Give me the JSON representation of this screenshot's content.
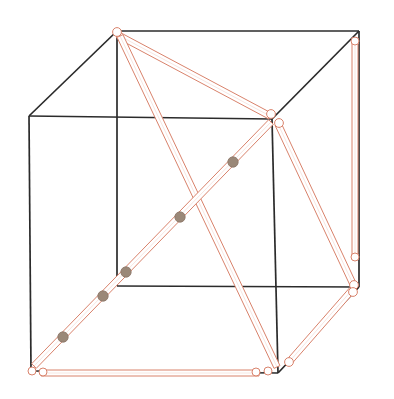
{
  "figure": {
    "canvas": {
      "width": 394,
      "height": 399,
      "background": "#ffffff"
    },
    "colors": {
      "cube_edge": "#2b2b2b",
      "strut_outline": "#d9826b",
      "strut_fill": "#ffffff",
      "joint_outline": "#d9826b",
      "joint_fill": "#ffffff",
      "node_fill": "#9a8878",
      "node_stroke": "#8a7464"
    },
    "stroke_widths": {
      "cube_edge": 1.7,
      "strut_outline": 1.0,
      "joint_outline": 1.0
    },
    "cube": {
      "label": "wireframe-cube",
      "vertices": {
        "front_top_left": {
          "name": "A",
          "x": 29,
          "y": 116
        },
        "front_top_right": {
          "name": "B",
          "x": 272,
          "y": 119
        },
        "front_bottom_left": {
          "name": "C",
          "x": 31,
          "y": 371
        },
        "front_bottom_right": {
          "name": "D",
          "x": 278,
          "y": 373
        },
        "back_top_left": {
          "name": "E",
          "x": 117,
          "y": 31
        },
        "back_top_right": {
          "name": "F",
          "x": 359,
          "y": 31
        },
        "back_bottom_left": {
          "name": "G",
          "x": 117,
          "y": 286
        },
        "back_bottom_right": {
          "name": "H",
          "x": 359,
          "y": 287
        }
      },
      "edges": [
        {
          "name": "front-top",
          "from": "front_top_left",
          "to": "front_top_right"
        },
        {
          "name": "front-left",
          "from": "front_top_left",
          "to": "front_bottom_left"
        },
        {
          "name": "front-bottom",
          "from": "front_bottom_left",
          "to": "front_bottom_right"
        },
        {
          "name": "front-right",
          "from": "front_top_right",
          "to": "front_bottom_right"
        },
        {
          "name": "back-top",
          "from": "back_top_left",
          "to": "back_top_right"
        },
        {
          "name": "back-left",
          "from": "back_top_left",
          "to": "back_bottom_left"
        },
        {
          "name": "back-bottom",
          "from": "back_bottom_left",
          "to": "back_bottom_right"
        },
        {
          "name": "back-right",
          "from": "back_top_right",
          "to": "back_bottom_right"
        },
        {
          "name": "top-left-connect",
          "from": "front_top_left",
          "to": "back_top_left"
        },
        {
          "name": "top-right-connect",
          "from": "front_top_right",
          "to": "back_top_right"
        },
        {
          "name": "bottom-right-connect",
          "from": "front_bottom_right",
          "to": "back_bottom_right"
        }
      ]
    },
    "struts": [
      {
        "name": "strut-back-top-left-to-front-top-right",
        "x1": 118,
        "y1": 35,
        "x2": 270,
        "y2": 116,
        "width": 6.5
      },
      {
        "name": "strut-back-top-left-to-front-bottom-right-long",
        "x1": 120,
        "y1": 36,
        "x2": 277,
        "y2": 367,
        "width": 6.5
      },
      {
        "name": "strut-front-bottom-left-to-front-top-right-diagonal",
        "x1": 34,
        "y1": 366,
        "x2": 271,
        "y2": 122,
        "width": 6.5
      },
      {
        "name": "strut-bottom-horizontal",
        "x1": 41,
        "y1": 373,
        "x2": 259,
        "y2": 373,
        "width": 6.0
      },
      {
        "name": "strut-right-vertical",
        "x1": 355,
        "y1": 41,
        "x2": 355,
        "y2": 258,
        "width": 6.0
      },
      {
        "name": "strut-front-top-right-to-right-bottom",
        "x1": 278,
        "y1": 124,
        "x2": 353,
        "y2": 284,
        "width": 6.5
      },
      {
        "name": "strut-right-bottom-to-front-bottom-right",
        "x1": 352,
        "y1": 290,
        "x2": 289,
        "y2": 362,
        "width": 6.5
      }
    ],
    "joints": [
      {
        "name": "joint-back-top-left",
        "x": 117,
        "y": 32,
        "r": 4.4
      },
      {
        "name": "joint-front-top-right-upper",
        "x": 271,
        "y": 114,
        "r": 4.4
      },
      {
        "name": "joint-front-top-right-lower",
        "x": 279,
        "y": 123,
        "r": 4.4
      },
      {
        "name": "joint-front-bottom-left-a",
        "x": 32,
        "y": 371,
        "r": 4.0
      },
      {
        "name": "joint-front-bottom-left-b",
        "x": 43,
        "y": 372,
        "r": 4.0
      },
      {
        "name": "joint-bottom-mid-right",
        "x": 256,
        "y": 372,
        "r": 4.0
      },
      {
        "name": "joint-front-bottom-right",
        "x": 268,
        "y": 371,
        "r": 4.0
      },
      {
        "name": "joint-bottom-right-outer",
        "x": 289,
        "y": 362,
        "r": 4.4
      },
      {
        "name": "joint-right-top",
        "x": 355,
        "y": 41,
        "r": 4.0
      },
      {
        "name": "joint-right-mid",
        "x": 355,
        "y": 257,
        "r": 4.0
      },
      {
        "name": "joint-right-bottom",
        "x": 354,
        "y": 285,
        "r": 4.4
      },
      {
        "name": "joint-right-bottom-lower",
        "x": 353,
        "y": 292,
        "r": 4.4
      }
    ],
    "diagonal_nodes": [
      {
        "name": "diagonal-node-1",
        "x": 233,
        "y": 162,
        "r": 5.2
      },
      {
        "name": "diagonal-node-2",
        "x": 180,
        "y": 217,
        "r": 5.2
      },
      {
        "name": "diagonal-node-3",
        "x": 126,
        "y": 272,
        "r": 5.2
      },
      {
        "name": "diagonal-node-4",
        "x": 103,
        "y": 296,
        "r": 5.2
      },
      {
        "name": "diagonal-node-5",
        "x": 63,
        "y": 337,
        "r": 5.2
      }
    ]
  }
}
